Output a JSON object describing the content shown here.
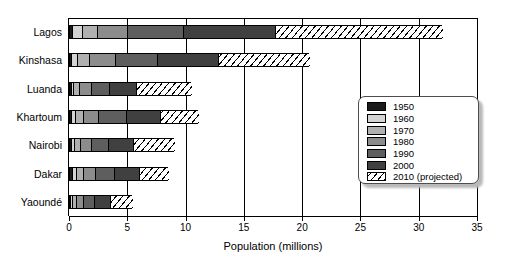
{
  "chart_data": {
    "type": "bar",
    "orientation": "horizontal",
    "stacked": true,
    "title": "",
    "xlabel": "Population (millions)",
    "ylabel": "",
    "xlim": [
      0,
      35
    ],
    "xticks": [
      0,
      5,
      10,
      15,
      20,
      25,
      30,
      35
    ],
    "xticklabels": [
      "0",
      "5",
      "10",
      "15",
      "20",
      "25",
      "30",
      "35"
    ],
    "grid": true,
    "grid_axis": "x",
    "legend_position": "center-right",
    "categories": [
      "Lagos",
      "Kinshasa",
      "Luanda",
      "Khartoum",
      "Nairobi",
      "Dakar",
      "Yaoundé"
    ],
    "series": [
      {
        "name": "1950",
        "color": "#1a1a1a",
        "values": [
          0.3,
          0.2,
          0.14,
          0.18,
          0.14,
          0.23,
          0.1
        ]
      },
      {
        "name": "1960",
        "color": "#d4d4d4",
        "values": [
          0.8,
          0.45,
          0.22,
          0.3,
          0.28,
          0.4,
          0.17
        ]
      },
      {
        "name": "1970",
        "color": "#b0b0b0",
        "values": [
          1.3,
          1.1,
          0.5,
          0.75,
          0.5,
          0.6,
          0.3
        ]
      },
      {
        "name": "1980",
        "color": "#8c8c8c",
        "values": [
          2.6,
          2.2,
          1.0,
          1.3,
          1.0,
          1.0,
          0.67
        ]
      },
      {
        "name": "1990",
        "color": "#5e5e5e",
        "values": [
          4.8,
          3.6,
          1.6,
          2.4,
          1.4,
          1.6,
          0.9
        ]
      },
      {
        "name": "2000",
        "color": "#404040",
        "values": [
          7.9,
          5.2,
          2.3,
          2.9,
          2.2,
          2.2,
          1.4
        ]
      },
      {
        "name": "2010 (projected)",
        "color": "#ffffff",
        "hatch": true,
        "values": [
          14.3,
          7.8,
          4.7,
          3.2,
          3.5,
          2.5,
          1.9
        ]
      }
    ],
    "totals": [
      32.0,
      20.55,
      10.46,
      11.03,
      9.02,
      8.53,
      5.44
    ]
  },
  "legend": {
    "entries": [
      {
        "label": "1950"
      },
      {
        "label": "1960"
      },
      {
        "label": "1970"
      },
      {
        "label": "1980"
      },
      {
        "label": "1990"
      },
      {
        "label": "2000"
      },
      {
        "label": "2010 (projected)"
      }
    ]
  }
}
